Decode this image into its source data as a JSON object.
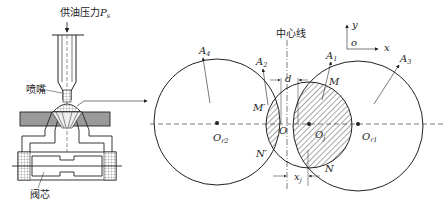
{
  "nozzle_diagram": {
    "supply_pressure_label": "供油压力",
    "supply_pressure_symbol": "P",
    "supply_pressure_subscript": "s",
    "nozzle_label": "喷嘴",
    "spool_label": "阀芯"
  },
  "geometry_diagram": {
    "centerline_label": "中心线",
    "axes": {
      "origin": "o",
      "x": "x",
      "y": "y"
    },
    "areas": [
      {
        "name": "A",
        "sub": "4"
      },
      {
        "name": "A",
        "sub": "2"
      },
      {
        "name": "A",
        "sub": "1"
      },
      {
        "name": "A",
        "sub": "3"
      }
    ],
    "points": {
      "M": "M",
      "M_prime": "M′",
      "N": "N",
      "N_prime": "N′",
      "O": "O"
    },
    "centers": [
      {
        "name": "O",
        "sub": "r2"
      },
      {
        "name": "O",
        "sub": "j"
      },
      {
        "name": "O",
        "sub": "r1"
      }
    ],
    "dimensions": {
      "d": "d",
      "x_j": "x",
      "x_j_sub": "j"
    }
  },
  "colors": {
    "line": "#222222",
    "plate_fill": "#9a9a9a",
    "background": "#ffffff"
  }
}
